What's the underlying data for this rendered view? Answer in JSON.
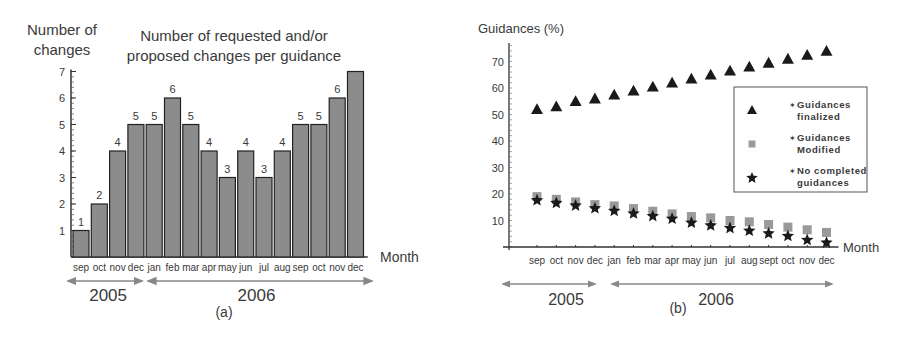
{
  "chart_data": [
    {
      "type": "bar",
      "panel_label": "(a)",
      "title": "Number of requested and/or proposed changes per guidance",
      "title_lines": [
        "Number of requested and/or",
        "proposed changes per guidance"
      ],
      "ylabel_lines": [
        "Number of",
        "changes"
      ],
      "xlabel": "Month",
      "categories": [
        "sep",
        "oct",
        "nov",
        "dec",
        "jan",
        "feb",
        "mar",
        "apr",
        "may",
        "jun",
        "jul",
        "aug",
        "sep",
        "oct",
        "nov",
        "dec"
      ],
      "values": [
        1,
        2,
        4,
        5,
        5,
        6,
        5,
        4,
        3,
        4,
        3,
        4,
        5,
        5,
        6,
        7
      ],
      "data_labels": [
        "1",
        "2",
        "4",
        "5",
        "5",
        "6",
        "5",
        "4",
        "3",
        "4",
        "3",
        "4",
        "5",
        "5",
        "6",
        ""
      ],
      "yticks": [
        1,
        2,
        3,
        4,
        5,
        6,
        7
      ],
      "ylim": [
        0,
        7
      ],
      "year_groups": [
        {
          "label": "2005",
          "months": [
            "sep",
            "oct",
            "nov",
            "dec"
          ]
        },
        {
          "label": "2006",
          "months": [
            "jan",
            "feb",
            "mar",
            "apr",
            "may",
            "jun",
            "jul",
            "aug",
            "sep",
            "oct",
            "nov",
            "dec"
          ]
        }
      ],
      "bar_color": "#8c8c8c",
      "grid": false
    },
    {
      "type": "scatter",
      "panel_label": "(b)",
      "ylabel": "Guidances (%)",
      "xlabel": "Month",
      "categories": [
        "sep",
        "oct",
        "nov",
        "dec",
        "jan",
        "feb",
        "mar",
        "apr",
        "may",
        "jun",
        "jul",
        "aug",
        "sept",
        "oct",
        "nov",
        "dec"
      ],
      "series": [
        {
          "name": "Guidances finalized",
          "marker": "triangle",
          "color": "#1a1a1a",
          "values": [
            52,
            53,
            55,
            56,
            57.5,
            59,
            60.5,
            62,
            63.5,
            65,
            66.5,
            68,
            69.5,
            71,
            72.5,
            74
          ]
        },
        {
          "name": "Guidances Modified",
          "marker": "square",
          "color": "#9a9a9a",
          "values": [
            19,
            18,
            17,
            16,
            15.5,
            14.5,
            13.5,
            12.5,
            11.5,
            11,
            10,
            9.5,
            8.5,
            7.5,
            6.5,
            5.5
          ]
        },
        {
          "name": "No completed guidances",
          "marker": "star",
          "color": "#1a1a1a",
          "values": [
            18,
            17,
            16,
            15,
            14,
            13,
            12,
            11,
            9.5,
            8.5,
            7.5,
            6.5,
            5.5,
            4.5,
            3,
            2
          ]
        }
      ],
      "legend": [
        {
          "lines": [
            "Guidances",
            "finalized"
          ]
        },
        {
          "lines": [
            "Guidances",
            "Modified"
          ]
        },
        {
          "lines": [
            "No completed",
            "guidances"
          ]
        }
      ],
      "legend_position": "right, middle",
      "yticks": [
        10,
        20,
        30,
        40,
        50,
        60,
        70
      ],
      "ylim": [
        0,
        77
      ],
      "year_groups": [
        {
          "label": "2005",
          "months": [
            "sep",
            "oct",
            "nov",
            "dec"
          ]
        },
        {
          "label": "2006",
          "months": [
            "jan",
            "feb",
            "mar",
            "apr",
            "may",
            "jun",
            "jul",
            "aug",
            "sept",
            "oct",
            "nov",
            "dec"
          ]
        }
      ],
      "grid": false
    }
  ]
}
